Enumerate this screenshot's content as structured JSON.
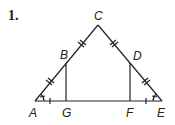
{
  "problem": {
    "number": "1."
  },
  "figure": {
    "points": {
      "A": {
        "label": "A",
        "x": 35,
        "y": 101
      },
      "B": {
        "label": "B",
        "x": 66,
        "y": 63
      },
      "C": {
        "label": "C",
        "x": 98,
        "y": 25
      },
      "D": {
        "label": "D",
        "x": 130,
        "y": 63
      },
      "E": {
        "label": "E",
        "x": 162,
        "y": 101
      },
      "F": {
        "label": "F",
        "x": 130,
        "y": 101
      },
      "G": {
        "label": "G",
        "x": 66,
        "y": 101
      }
    },
    "segments": [
      "AC",
      "CE",
      "AE",
      "BG",
      "DF"
    ],
    "marks": {
      "double_ticks": [
        "AB",
        "BC",
        "CD",
        "DE"
      ],
      "single_ticks": [
        "AG",
        "FE"
      ],
      "angle_arcs": [
        "A",
        "E"
      ]
    },
    "stroke_color": "#222222"
  }
}
